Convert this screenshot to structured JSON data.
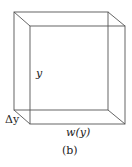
{
  "diagram": {
    "type": "3d-box",
    "labels": {
      "height": "y",
      "thickness": "Δy",
      "width": "w(y)",
      "caption": "(b)"
    },
    "line_color": "#555555"
  }
}
